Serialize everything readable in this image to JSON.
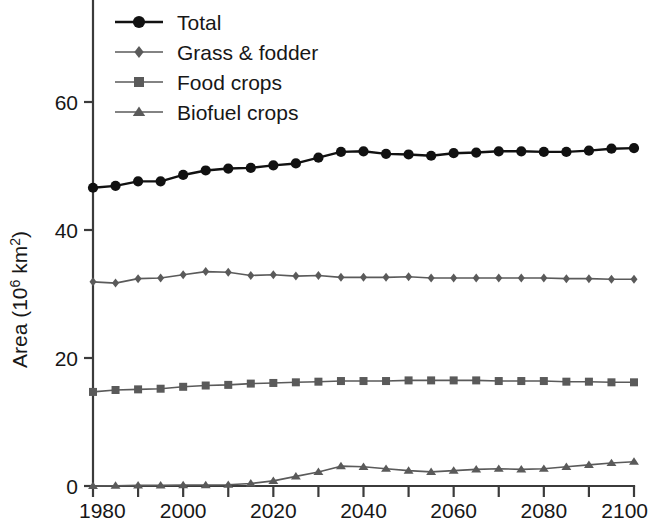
{
  "chart_data": {
    "type": "line",
    "title": "",
    "xlabel": "",
    "ylabel": "Area (10⁶ km²)",
    "ylabel_parts": {
      "prefix": "Area (10",
      "sup1": "6",
      "mid": " km",
      "sup2": "2",
      "suffix": ")"
    },
    "xlim": [
      1980,
      2100
    ],
    "ylim": [
      0,
      70
    ],
    "grid": false,
    "legend_position": "top-left",
    "x_ticks": [
      1980,
      2000,
      2020,
      2040,
      2060,
      2080,
      2100
    ],
    "x_ticks_minor": [
      1990,
      2010,
      2030,
      2050,
      2070,
      2090
    ],
    "x_tick_labels": [
      "1980",
      "2000",
      "2020",
      "2040",
      "2060",
      "2080",
      "2100"
    ],
    "y_ticks": [
      0,
      20,
      40,
      60
    ],
    "y_tick_labels": [
      "0",
      "20",
      "40",
      "60"
    ],
    "x": [
      1980,
      1985,
      1990,
      1995,
      2000,
      2005,
      2010,
      2015,
      2020,
      2025,
      2030,
      2035,
      2040,
      2045,
      2050,
      2055,
      2060,
      2065,
      2070,
      2075,
      2080,
      2085,
      2090,
      2095,
      2100
    ],
    "series": [
      {
        "name": "Total",
        "marker": "circle",
        "color": "#111111",
        "line_width": 2.4,
        "marker_size": 9,
        "values": [
          46.6,
          46.9,
          47.6,
          47.6,
          48.6,
          49.3,
          49.6,
          49.7,
          50.1,
          50.4,
          51.3,
          52.2,
          52.3,
          51.9,
          51.8,
          51.6,
          52.0,
          52.1,
          52.3,
          52.3,
          52.2,
          52.2,
          52.4,
          52.7,
          52.8
        ]
      },
      {
        "name": "Grass & fodder",
        "marker": "diamond",
        "color": "#5a5a5a",
        "line_width": 1.6,
        "marker_size": 7,
        "values": [
          31.9,
          31.7,
          32.4,
          32.5,
          33.0,
          33.5,
          33.4,
          32.9,
          33.0,
          32.8,
          32.9,
          32.6,
          32.6,
          32.6,
          32.7,
          32.5,
          32.5,
          32.5,
          32.5,
          32.5,
          32.5,
          32.4,
          32.4,
          32.3,
          32.3
        ]
      },
      {
        "name": "Food crops",
        "marker": "square",
        "color": "#5a5a5a",
        "line_width": 1.6,
        "marker_size": 8,
        "values": [
          14.7,
          15.0,
          15.1,
          15.2,
          15.5,
          15.7,
          15.8,
          16.0,
          16.1,
          16.2,
          16.3,
          16.4,
          16.4,
          16.4,
          16.5,
          16.5,
          16.5,
          16.5,
          16.4,
          16.4,
          16.4,
          16.3,
          16.3,
          16.2,
          16.2
        ]
      },
      {
        "name": "Biofuel crops",
        "marker": "triangle",
        "color": "#5a5a5a",
        "line_width": 1.6,
        "marker_size": 8,
        "values": [
          0.0,
          0.05,
          0.1,
          0.1,
          0.15,
          0.15,
          0.2,
          0.4,
          0.8,
          1.5,
          2.2,
          3.1,
          3.0,
          2.7,
          2.4,
          2.2,
          2.4,
          2.6,
          2.7,
          2.6,
          2.7,
          3.0,
          3.3,
          3.6,
          3.8
        ]
      }
    ],
    "legend": [
      {
        "label": "Total",
        "marker": "circle",
        "color": "#111111"
      },
      {
        "label": "Grass & fodder",
        "marker": "diamond",
        "color": "#5a5a5a"
      },
      {
        "label": "Food crops",
        "marker": "square",
        "color": "#5a5a5a"
      },
      {
        "label": "Biofuel crops",
        "marker": "triangle",
        "color": "#5a5a5a"
      }
    ]
  }
}
